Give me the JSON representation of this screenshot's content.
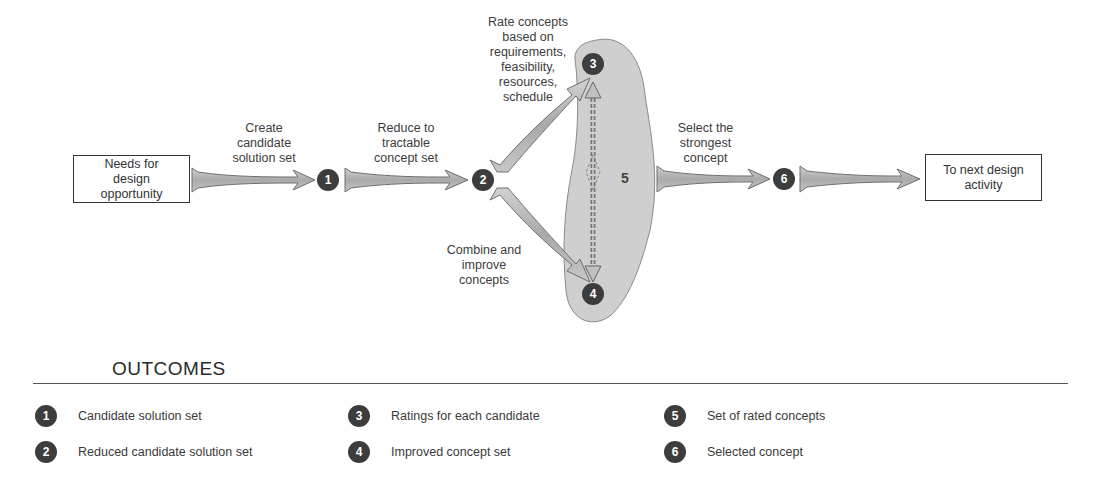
{
  "diagram": {
    "start_box": "Needs for design opportunity",
    "end_box": "To next design activity",
    "steps": [
      {
        "id": "1",
        "label": "Create candidate solution set"
      },
      {
        "id": "2",
        "label": "Reduce to tractable concept set"
      },
      {
        "id": "3",
        "label": "Rate concepts based on requirements, feasibility, resources, schedule"
      },
      {
        "id": "4",
        "label": "Combine and improve concepts"
      },
      {
        "id": "5",
        "label": ""
      },
      {
        "id": "6",
        "label": "Select the strongest concept"
      }
    ],
    "nodes": [
      "1",
      "2",
      "3",
      "4",
      "5",
      "6"
    ],
    "colors": {
      "node_fill": "#3d3d3d",
      "node_text": "#ffffff",
      "arrow_fill": "#b8b8b8",
      "arrow_stroke": "#6e6e6e",
      "blob_fill": "#cfcfcf",
      "blob_stroke": "#8a8a8a"
    }
  },
  "outcomes": {
    "heading": "OUTCOMES",
    "items": [
      {
        "num": "1",
        "text": "Candidate solution set"
      },
      {
        "num": "2",
        "text": "Reduced candidate solution set"
      },
      {
        "num": "3",
        "text": "Ratings for each candidate"
      },
      {
        "num": "4",
        "text": "Improved concept set"
      },
      {
        "num": "5",
        "text": "Set of rated concepts"
      },
      {
        "num": "6",
        "text": "Selected concept"
      }
    ]
  }
}
